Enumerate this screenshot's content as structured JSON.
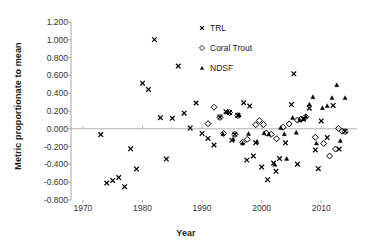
{
  "chart_data": {
    "type": "scatter",
    "title": "",
    "xlabel": "Year",
    "ylabel": "Metric proportionate to mean",
    "xlim": [
      1968,
      2016
    ],
    "ylim": [
      -0.8,
      1.2
    ],
    "xticks": [
      1970,
      1980,
      1990,
      2000,
      2010
    ],
    "xtick_labels": [
      "1970",
      "1980",
      "1990",
      "2000",
      "2010"
    ],
    "yticks": [
      1.2,
      1.0,
      0.8,
      0.6,
      0.4,
      0.2,
      0.0,
      -0.2,
      -0.4,
      -0.6,
      -0.8
    ],
    "ytick_labels": [
      "1.200",
      "1.000",
      "0.800",
      "0.600",
      "0.400",
      "0.200",
      "0.000",
      "-0.200",
      "-0.400",
      "-0.600",
      "-0.800"
    ],
    "grid": false,
    "zero_line": true,
    "legend_position": "top-center-right",
    "series": [
      {
        "name": "TRL",
        "marker": "cross",
        "color": "#000000",
        "points": [
          [
            1973,
            -0.065
          ],
          [
            1974,
            -0.61
          ],
          [
            1975,
            -0.58
          ],
          [
            1976,
            -0.548
          ],
          [
            1977,
            -0.65
          ],
          [
            1978,
            -0.225
          ],
          [
            1979,
            -0.452
          ],
          [
            1980,
            0.512
          ],
          [
            1981,
            0.442
          ],
          [
            1982,
            1.002
          ],
          [
            1983,
            0.125
          ],
          [
            1984,
            -0.34
          ],
          [
            1985,
            0.118
          ],
          [
            1986,
            0.705
          ],
          [
            1987,
            0.175
          ],
          [
            1988,
            0.008
          ],
          [
            1989,
            0.29
          ],
          [
            1990,
            -0.052
          ],
          [
            1991,
            -0.108
          ],
          [
            1992,
            -0.182
          ],
          [
            1993,
            0.132
          ],
          [
            1994,
            0.192
          ],
          [
            1994.6,
            0.182
          ],
          [
            1995,
            -0.128
          ],
          [
            1995.5,
            -0.062
          ],
          [
            1996,
            0.152
          ],
          [
            1997,
            0.292
          ],
          [
            1997.5,
            -0.352
          ],
          [
            1998,
            0.255
          ],
          [
            1998.6,
            -0.305
          ],
          [
            1999,
            -0.158
          ],
          [
            2000,
            -0.43
          ],
          [
            2001,
            -0.572
          ],
          [
            2002,
            -0.385
          ],
          [
            2002.4,
            -0.478
          ],
          [
            2003,
            -0.335
          ],
          [
            2004,
            -0.158
          ],
          [
            2005,
            0.272
          ],
          [
            2005.4,
            0.618
          ],
          [
            2006,
            -0.398
          ],
          [
            2007,
            0.11
          ],
          [
            2008,
            0.232
          ],
          [
            2009,
            -0.238
          ],
          [
            2009.5,
            -0.448
          ],
          [
            2010,
            0.088
          ],
          [
            2011,
            -0.098
          ],
          [
            2012,
            0.262
          ],
          [
            2013,
            -0.228
          ],
          [
            2014,
            -0.028
          ]
        ]
      },
      {
        "name": "Coral Trout",
        "marker": "diamond-open",
        "color": "#000000",
        "points": [
          [
            1991,
            0.058
          ],
          [
            1992,
            0.242
          ],
          [
            1993,
            0.128
          ],
          [
            1993.6,
            -0.052
          ],
          [
            1994.6,
            0.182
          ],
          [
            1995.5,
            -0.062
          ],
          [
            1996,
            0.148
          ],
          [
            1996.8,
            -0.152
          ],
          [
            1997.6,
            -0.118
          ],
          [
            1999,
            0.045
          ],
          [
            1999.6,
            0.092
          ],
          [
            2000.3,
            0.048
          ],
          [
            2000.8,
            -0.048
          ],
          [
            2001.6,
            -0.062
          ],
          [
            2002.5,
            -0.112
          ],
          [
            2003.6,
            0.018
          ],
          [
            2004.6,
            0.055
          ],
          [
            2006,
            0.098
          ],
          [
            2006.6,
            0.108
          ],
          [
            2007.4,
            0.135
          ],
          [
            2009,
            -0.095
          ],
          [
            2010.4,
            -0.165
          ],
          [
            2011.4,
            -0.305
          ],
          [
            2012.4,
            -0.228
          ],
          [
            2012.9,
            0.005
          ],
          [
            2013.5,
            -0.028
          ],
          [
            2014,
            -0.032
          ]
        ]
      },
      {
        "name": "NDSF",
        "marker": "triangle-filled",
        "color": "#000000",
        "points": [
          [
            1993.5,
            -0.058
          ],
          [
            1994.2,
            0.185
          ],
          [
            1995.2,
            -0.118
          ],
          [
            1996.2,
            0.152
          ],
          [
            1996.8,
            -0.162
          ],
          [
            1997.8,
            -0.055
          ],
          [
            1999.2,
            -0.145
          ],
          [
            2000.4,
            -0.048
          ],
          [
            2001.2,
            -0.062
          ],
          [
            2002.2,
            -0.402
          ],
          [
            2003.2,
            0.012
          ],
          [
            2003.8,
            -0.058
          ],
          [
            2004.2,
            -0.335
          ],
          [
            2005.2,
            0.125
          ],
          [
            2005.8,
            -0.042
          ],
          [
            2006.4,
            0.098
          ],
          [
            2007,
            0.108
          ],
          [
            2007.4,
            0.138
          ],
          [
            2008,
            0.275
          ],
          [
            2008.6,
            0.358
          ],
          [
            2009.2,
            -0.162
          ],
          [
            2010.2,
            0.235
          ],
          [
            2011,
            0.258
          ],
          [
            2011.8,
            0.348
          ],
          [
            2012.6,
            0.492
          ],
          [
            2013.2,
            -0.135
          ],
          [
            2014,
            0.348
          ]
        ]
      }
    ]
  },
  "legend": {
    "items": [
      {
        "label": "TRL",
        "marker": "cross"
      },
      {
        "label": "Coral Trout",
        "marker": "diamond-open"
      },
      {
        "label": "NDSF",
        "marker": "triangle-filled"
      }
    ]
  },
  "colors": {
    "marker": "#000000",
    "axis": "#9a9a9a",
    "zero_line": "#a8a8a8",
    "text": "#333333",
    "title_text": "#1a1a1a"
  }
}
